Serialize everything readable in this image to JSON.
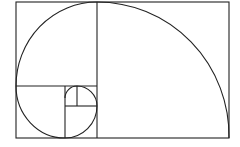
{
  "diagram": {
    "background": "#ffffff",
    "stroke_color": "#222222",
    "outer_rect": {
      "x": 16,
      "y": 2,
      "w": 213,
      "h": 136
    },
    "squares": [
      {
        "x": 97,
        "y": 2,
        "size": 132
      },
      {
        "x": 16,
        "y": 2,
        "size": 81
      },
      {
        "x": 16,
        "y": 86,
        "size": 49
      },
      {
        "x": 65,
        "y": 106,
        "size": 32
      },
      {
        "x": 77,
        "y": 86,
        "size": 20
      },
      {
        "x": 65,
        "y": 86,
        "size": 12
      }
    ]
  }
}
